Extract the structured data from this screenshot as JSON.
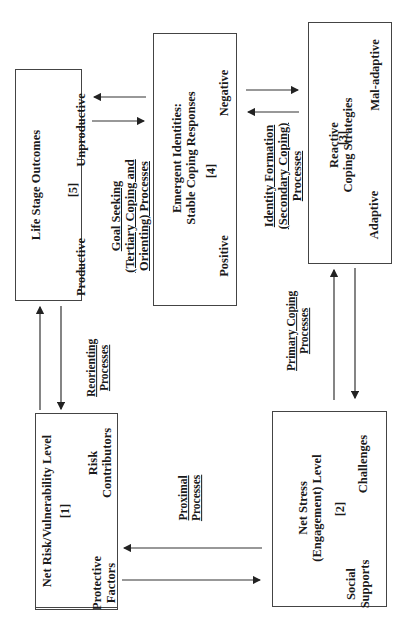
{
  "boxes": {
    "life_stage": {
      "title": "Life Stage Outcomes",
      "number": "[5]",
      "left": "Productive",
      "right": "Unproductive"
    },
    "emergent": {
      "title_line1": "Emergent Identities:",
      "title_line2": "Stable Coping Responses",
      "number": "[4]",
      "left": "Positive",
      "right": "Negative"
    },
    "reactive": {
      "title_line1": "Reactive",
      "title_line2": "Coping Strategies",
      "number": "[3]",
      "left": "Adaptive",
      "right": "Mal-adaptive"
    },
    "net_risk": {
      "title": "Net Risk/Vulnerability Level",
      "number": "[1]",
      "left_line1": "Protective",
      "left_line2": "Factors",
      "right_line1": "Risk",
      "right_line2": "Contributors"
    },
    "net_stress": {
      "title_line1": "Net Stress",
      "title_line2": "(Engagement) Level",
      "number": "[2]",
      "left_line1": "Social",
      "left_line2": "Supports",
      "right": "Challenges"
    }
  },
  "process_labels": {
    "goal_seeking": [
      "Goal Seeking",
      "(Tertiary Coping and",
      "Orienting) Processes"
    ],
    "identity_formation": [
      "Identity Formation",
      "(Secondary Coping)",
      "Processes"
    ],
    "reorienting": [
      "Reorienting",
      "Processes"
    ],
    "primary_coping": [
      "Primary Coping",
      "Processes"
    ],
    "proximal": [
      "Proximal",
      "Processes"
    ]
  },
  "colors": {
    "border": "#444444",
    "text": "#1a1a1a",
    "bidirectional_arrow": "#555555"
  }
}
